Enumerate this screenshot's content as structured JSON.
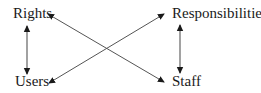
{
  "diagram": {
    "type": "relationship",
    "nodes": [
      {
        "id": "rights",
        "label": "Rights",
        "x": 13,
        "y": 18
      },
      {
        "id": "responsibilities",
        "label": "Responsibilities",
        "x": 172,
        "y": 18
      },
      {
        "id": "users",
        "label": "Users",
        "x": 15,
        "y": 86
      },
      {
        "id": "staff",
        "label": "Staff",
        "x": 172,
        "y": 86
      }
    ],
    "edges": [
      {
        "from": "rights",
        "to": "users",
        "direction": "both",
        "style": "vertical"
      },
      {
        "from": "responsibilities",
        "to": "staff",
        "direction": "both",
        "style": "vertical"
      },
      {
        "from": "staff",
        "to": "rights",
        "direction": "both",
        "style": "diagonal"
      },
      {
        "from": "users",
        "to": "responsibilities",
        "direction": "both",
        "style": "diagonal"
      }
    ],
    "colors": {
      "line": "#555555",
      "text": "#1a1a1a",
      "background": "#ffffff"
    }
  }
}
